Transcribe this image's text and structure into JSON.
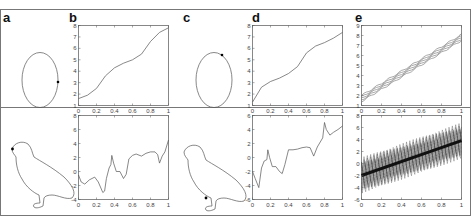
{
  "figure": {
    "panel_labels": [
      "a",
      "b",
      "c",
      "d",
      "e"
    ]
  },
  "chart_data": [
    {
      "panel": "a-top",
      "type": "shape",
      "description": "Ellipse outline with a marked point on the right side"
    },
    {
      "panel": "a-bottom",
      "type": "shape",
      "description": "Bird (grouse) outline with a marked point at the beak"
    },
    {
      "panel": "b-top",
      "type": "line",
      "x": [
        0,
        0.1,
        0.2,
        0.3,
        0.4,
        0.5,
        0.6,
        0.7,
        0.8,
        0.9,
        1.0
      ],
      "values": [
        1.6,
        1.9,
        2.5,
        3.6,
        4.3,
        4.7,
        5.0,
        5.5,
        6.6,
        7.4,
        7.8
      ],
      "xlim": [
        0,
        1
      ],
      "ylim": [
        1,
        8
      ],
      "xticks": [
        "0",
        "0.2",
        "0.4",
        "0.6",
        "0.8",
        "1"
      ],
      "yticks": [
        "1",
        "2",
        "3",
        "4",
        "5",
        "6",
        "7",
        "8"
      ]
    },
    {
      "panel": "b-bottom",
      "type": "line",
      "x": [
        0,
        0.03,
        0.07,
        0.12,
        0.18,
        0.22,
        0.27,
        0.29,
        0.31,
        0.34,
        0.36,
        0.37,
        0.39,
        0.42,
        0.46,
        0.5,
        0.53,
        0.56,
        0.6,
        0.64,
        0.7,
        0.75,
        0.8,
        0.85,
        0.88,
        0.9,
        0.93,
        0.96,
        1.0
      ],
      "values": [
        -0.5,
        -1.5,
        -1.8,
        -1.2,
        -0.8,
        -1.5,
        -3.0,
        -2.8,
        -1.0,
        0.5,
        1.0,
        2.3,
        1.2,
        0.0,
        0.0,
        -1.0,
        -0.4,
        1.8,
        2.3,
        2.5,
        2.2,
        2.6,
        2.8,
        2.8,
        2.4,
        1.2,
        2.2,
        2.8,
        4.5
      ],
      "xlim": [
        0,
        1
      ],
      "ylim": [
        -4,
        8
      ],
      "xticks": [
        "0",
        "0.2",
        "0.4",
        "0.6",
        "0.8",
        "1"
      ],
      "yticks": [
        "-4",
        "-2",
        "0",
        "2",
        "4",
        "6",
        "8"
      ]
    },
    {
      "panel": "c-top",
      "type": "shape",
      "description": "Ellipse outline with a marked point on the upper right"
    },
    {
      "panel": "c-bottom",
      "type": "shape",
      "description": "Bird (grouse) outline with a marked point at the leg"
    },
    {
      "panel": "d-top",
      "type": "line",
      "x": [
        0,
        0.1,
        0.2,
        0.3,
        0.4,
        0.5,
        0.6,
        0.7,
        0.8,
        0.9,
        1.0
      ],
      "values": [
        1.3,
        2.6,
        3.1,
        3.4,
        3.8,
        4.4,
        5.6,
        6.2,
        6.5,
        6.9,
        7.4
      ],
      "xlim": [
        0,
        1
      ],
      "ylim": [
        1,
        8
      ],
      "xticks": [
        "0",
        "0.2",
        "0.4",
        "0.6",
        "0.8",
        "1"
      ],
      "yticks": [
        "1",
        "2",
        "3",
        "4",
        "5",
        "6",
        "7",
        "8"
      ]
    },
    {
      "panel": "d-bottom",
      "type": "line",
      "x": [
        0,
        0.03,
        0.07,
        0.1,
        0.13,
        0.16,
        0.17,
        0.19,
        0.22,
        0.26,
        0.3,
        0.33,
        0.36,
        0.4,
        0.45,
        0.5,
        0.55,
        0.6,
        0.64,
        0.68,
        0.72,
        0.78,
        0.8,
        0.82,
        0.86,
        0.9,
        0.95,
        1.0
      ],
      "values": [
        -2.0,
        -3.0,
        -4.3,
        -1.5,
        -0.5,
        -0.3,
        1.1,
        0.0,
        -1.3,
        -1.3,
        -2.0,
        -2.3,
        -1.0,
        1.1,
        1.1,
        1.2,
        1.4,
        1.5,
        1.4,
        0.2,
        1.5,
        2.8,
        5.0,
        4.0,
        3.2,
        3.6,
        4.0,
        4.5
      ],
      "xlim": [
        0,
        1
      ],
      "ylim": [
        -6,
        6
      ],
      "xticks": [
        "0",
        "0.2",
        "0.4",
        "0.6",
        "0.8",
        "1"
      ],
      "yticks": [
        "-6",
        "-4",
        "-2",
        "0",
        "2",
        "4",
        "6"
      ]
    },
    {
      "panel": "e-top",
      "type": "line",
      "description": "Bundle of nearly parallel linear lines",
      "series": [
        {
          "name": "upper",
          "x": [
            0,
            1
          ],
          "values": [
            2.0,
            8.1
          ]
        },
        {
          "name": "center",
          "x": [
            0,
            1
          ],
          "values": [
            1.7,
            7.8
          ]
        },
        {
          "name": "lower",
          "x": [
            0,
            1
          ],
          "values": [
            1.4,
            7.5
          ]
        }
      ],
      "xlim": [
        0,
        1
      ],
      "ylim": [
        1,
        9
      ],
      "xticks": [
        "0",
        "0.2",
        "0.4",
        "0.6",
        "0.8",
        "1"
      ],
      "yticks": [
        "1",
        "2",
        "3",
        "4",
        "5",
        "6",
        "7",
        "8",
        "9"
      ]
    },
    {
      "panel": "e-bottom",
      "type": "line",
      "description": "Dense band of oscillating linear lines around a dark central trend",
      "series": [
        {
          "name": "center",
          "x": [
            0,
            1
          ],
          "values": [
            -2.0,
            3.8
          ]
        },
        {
          "name": "band-upper",
          "x": [
            0,
            1
          ],
          "values": [
            0.0,
            6.0
          ]
        },
        {
          "name": "band-lower",
          "x": [
            0,
            1
          ],
          "values": [
            -4.5,
            1.5
          ]
        }
      ],
      "xlim": [
        0,
        1
      ],
      "ylim": [
        -6,
        8
      ],
      "xticks": [
        "0",
        "0.2",
        "0.4",
        "0.6",
        "0.8",
        "1"
      ],
      "yticks": [
        "-6",
        "-4",
        "-2",
        "0",
        "2",
        "4",
        "6",
        "8"
      ]
    }
  ]
}
